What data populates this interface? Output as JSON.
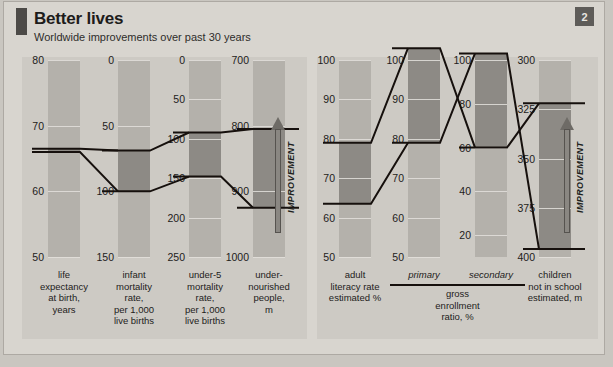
{
  "header": {
    "title": "Better lives",
    "subtitle": "Worldwide improvements over past 30 years",
    "badge": "2"
  },
  "improvement_label": "IMPROVEMENT",
  "chart_data": {
    "type": "line",
    "title": "Better lives",
    "subtitle": "Worldwide improvements over past 30 years",
    "panels": [
      {
        "name": "left",
        "metrics": [
          {
            "id": "life-expectancy",
            "label": "life expectancy at birth, years",
            "label_lines": [
              "life",
              "expectancy",
              "at birth,",
              "years"
            ],
            "ticks": [
              80,
              70,
              60,
              50
            ],
            "axis_top": 80,
            "axis_bottom": 50,
            "inverted": false,
            "start": 66,
            "end": 66.5
          },
          {
            "id": "infant-mortality",
            "label": "infant mortality rate, per 1,000 live births",
            "label_lines": [
              "infant",
              "mortality",
              "rate,",
              "per 1,000",
              "live births"
            ],
            "ticks": [
              0,
              50,
              100,
              150
            ],
            "axis_top": 0,
            "axis_bottom": 150,
            "inverted": true,
            "start": 100,
            "end": 69
          },
          {
            "id": "under5-mortality",
            "label": "under-5 mortality rate, per 1,000 live births",
            "label_lines": [
              "under-5",
              "mortality",
              "rate,",
              "per 1,000",
              "live births"
            ],
            "ticks": [
              0,
              50,
              100,
              150,
              200,
              250
            ],
            "axis_top": 0,
            "axis_bottom": 250,
            "inverted": true,
            "start": 148,
            "end": 92
          },
          {
            "id": "undernourished",
            "label": "under-nourished people, m",
            "label_lines": [
              "under-",
              "nourished",
              "people,",
              "m"
            ],
            "ticks": [
              700,
              800,
              900,
              1000
            ],
            "axis_top": 700,
            "axis_bottom": 1000,
            "inverted": true,
            "start": 925,
            "end": 805
          }
        ]
      },
      {
        "name": "right",
        "metrics": [
          {
            "id": "adult-literacy",
            "label": "adult literacy rate estimated %",
            "label_lines": [
              "adult",
              "literacy rate",
              "estimated %"
            ],
            "ticks": [
              100,
              90,
              80,
              70,
              60,
              50
            ],
            "axis_top": 100,
            "axis_bottom": 50,
            "inverted": false,
            "start": 63.5,
            "end": 79
          },
          {
            "id": "gross-enrollment-primary",
            "label": "primary",
            "group": "gross enrollment ratio, %",
            "ticks": [
              100,
              90,
              80,
              70,
              60,
              50
            ],
            "axis_top": 100,
            "axis_bottom": 50,
            "inverted": false,
            "start": 79,
            "end": 103
          },
          {
            "id": "gross-enrollment-secondary",
            "label": "secondary",
            "group": "gross enrollment ratio, %",
            "ticks": [
              100,
              80,
              60,
              40,
              20
            ],
            "axis_top": 100,
            "axis_bottom": 10,
            "inverted": false,
            "start": 103,
            "end": 60
          },
          {
            "id": "children-not-in-school",
            "label": "children not in school estimated, m",
            "label_lines": [
              "children",
              "not in school",
              "estimated, m"
            ],
            "ticks": [
              300,
              325,
              350,
              375,
              400
            ],
            "axis_top": 300,
            "axis_bottom": 400,
            "inverted": true,
            "start": 396,
            "end": 322
          }
        ]
      }
    ],
    "group_labels": {
      "gross_enrollment": [
        "gross",
        "enrollment",
        "ratio, %"
      ],
      "primary": "primary",
      "secondary": "secondary"
    }
  },
  "colors": {
    "paper": "#d8d5cf",
    "panel": "#cdcac4",
    "strip": "#b4b1ab",
    "strip_dark": "#8d8a85",
    "line": "#16100d",
    "accent": "#4c4a47",
    "badge": "#5e5c59"
  }
}
